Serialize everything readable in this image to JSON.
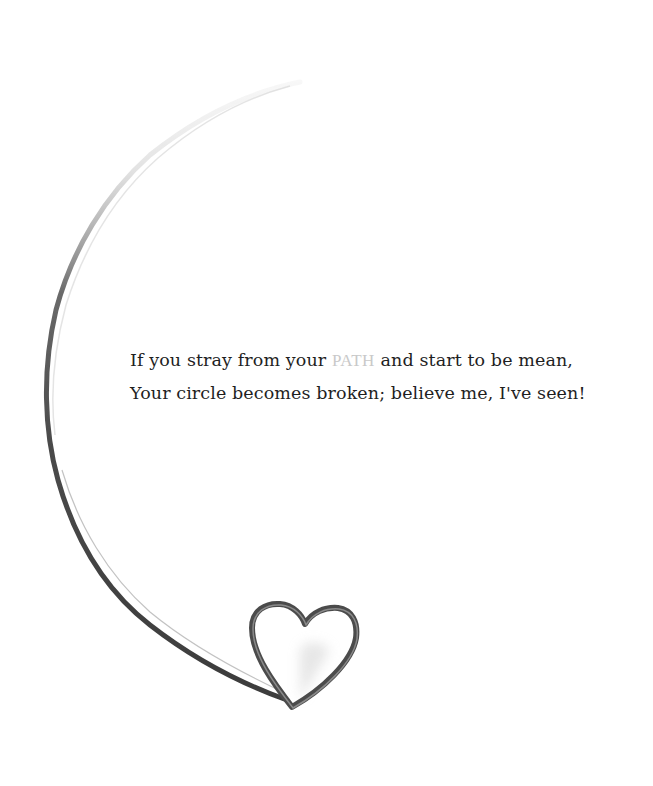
{
  "illustration": {
    "description": "Broken circular swoosh line ending in an open heart outline",
    "elements": [
      "arc-line-icon",
      "heart-outline-icon"
    ],
    "colors": {
      "background": "#ffffff",
      "text": "#1f1f1f",
      "highlight_word": "#c9c9c9",
      "stroke_dark": "#3a3a3a",
      "stroke_light": "#bdbdbd"
    }
  },
  "verse": {
    "line1": {
      "before": "If you stray from your ",
      "highlight": "PATH",
      "after": " and start to be mean,"
    },
    "line2": "Your circle becomes broken; believe me, I've seen!"
  }
}
